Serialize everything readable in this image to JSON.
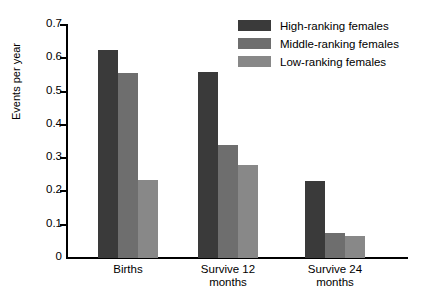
{
  "chart_data": {
    "type": "bar",
    "title": "",
    "xlabel": "",
    "ylabel": "Events per year",
    "ylim": [
      0,
      0.7
    ],
    "ytick_labels": [
      "0.7",
      "0.6",
      "0.5",
      "0.4",
      "0.3",
      "0.2",
      "0.1",
      "0"
    ],
    "ytick_values": [
      0.7,
      0.6,
      0.5,
      0.4,
      0.3,
      0.2,
      0.1,
      0
    ],
    "grid": false,
    "legend_position": "top-right",
    "categories": [
      "Births",
      "Survive 12 months",
      "Survive 24 months"
    ],
    "category_lines": [
      [
        "Births"
      ],
      [
        "Survive 12",
        "months"
      ],
      [
        "Survive 24",
        "months"
      ]
    ],
    "series": [
      {
        "name": "High-ranking females",
        "color": "#3a3a3a",
        "values": [
          0.625,
          0.56,
          0.23
        ]
      },
      {
        "name": "Middle-ranking females",
        "color": "#6e6e6e",
        "values": [
          0.555,
          0.34,
          0.075
        ]
      },
      {
        "name": "Low-ranking females",
        "color": "#888888",
        "values": [
          0.235,
          0.28,
          0.065
        ]
      }
    ]
  },
  "legend": {
    "items": [
      {
        "label": "High-ranking females",
        "color": "#3a3a3a"
      },
      {
        "label": "Middle-ranking females",
        "color": "#6e6e6e"
      },
      {
        "label": "Low-ranking females",
        "color": "#888888"
      }
    ]
  }
}
